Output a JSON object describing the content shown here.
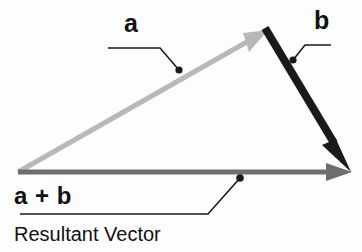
{
  "figure": {
    "background_color": "#fdfdfd"
  },
  "labels": {
    "vector_a": "a",
    "vector_b": "b",
    "resultant_expression": "a + b",
    "resultant_caption": "Resultant Vector"
  },
  "vectors": [
    {
      "id": "a",
      "label": "a",
      "color": "#b8b8b8",
      "thickness": 5,
      "start": [
        18,
        172
      ],
      "end": [
        268,
        30
      ],
      "arrowhead": "filled-triangle"
    },
    {
      "id": "b",
      "label": "b",
      "color": "#1a1a1a",
      "thickness": 8,
      "start": [
        265,
        28
      ],
      "end": [
        350,
        170
      ],
      "arrowhead": "filled-triangle"
    },
    {
      "id": "a_plus_b",
      "label": "a + b",
      "color": "#6e6e6e",
      "thickness": 5,
      "start": [
        18,
        172
      ],
      "end": [
        352,
        172
      ],
      "arrowhead": "filled-triangle"
    }
  ],
  "leaders": [
    {
      "id": "leader-a",
      "color": "#1a1a1a",
      "dot": [
        179,
        70
      ],
      "path": "M 108 48 L 160 48 L 179 70"
    },
    {
      "id": "leader-b",
      "color": "#1a1a1a",
      "dot": [
        293,
        60
      ],
      "path": "M 331 45 L 305 45 L 293 60"
    },
    {
      "id": "leader-sum",
      "color": "#1a1a1a",
      "dot": [
        240,
        178
      ],
      "path": "M 240 178 L 208 214 L 20 214"
    }
  ],
  "colors": {
    "vector_a": "#b8b8b8",
    "vector_b": "#1a1a1a",
    "resultant": "#6e6e6e",
    "leader_line": "#1a1a1a",
    "text": "#111111",
    "background": "#fdfdfd"
  }
}
